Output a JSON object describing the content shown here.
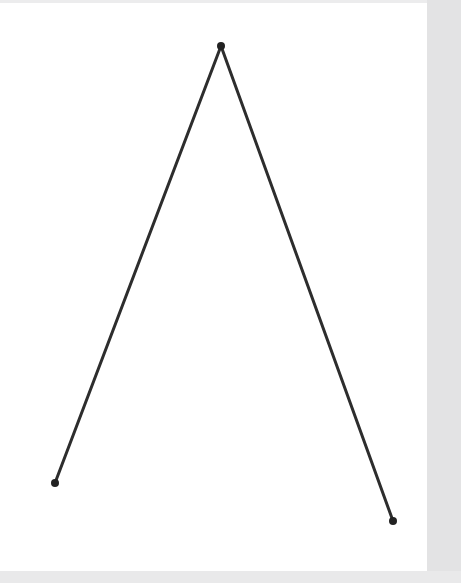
{
  "figure": {
    "title": "",
    "background_color": "#ffffff",
    "gutter_color": "#e6e6e7",
    "page": {
      "x": 0,
      "y": 3,
      "width": 427,
      "height": 568,
      "color": "#ffffff"
    },
    "gutters": {
      "top": {
        "height": 4,
        "color": "#ececed"
      },
      "right": {
        "width": 34,
        "color": "#e3e3e4"
      },
      "bottom": {
        "height": 12,
        "color": "#e9e9ea"
      }
    }
  },
  "chart_data": {
    "type": "line",
    "title": "",
    "subtitle": "",
    "xlabel": "",
    "ylabel": "",
    "grid": false,
    "legend": null,
    "xlim": [
      0,
      461
    ],
    "ylim": [
      583,
      0
    ],
    "series": [
      {
        "name": "polyline",
        "closed": false,
        "stroke_color": "#2d2d2d",
        "stroke_width": 3,
        "marker": "circle",
        "marker_size": 8,
        "marker_color": "#222222",
        "x": [
          55,
          221,
          393
        ],
        "y": [
          483,
          46,
          521
        ],
        "points": [
          {
            "label": "left-endpoint",
            "x": 55,
            "y": 483
          },
          {
            "label": "apex-vertex",
            "x": 221,
            "y": 46
          },
          {
            "label": "right-endpoint",
            "x": 393,
            "y": 521
          }
        ]
      }
    ],
    "annotations": []
  }
}
